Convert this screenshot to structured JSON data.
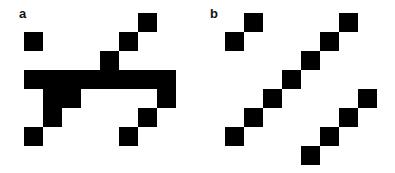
{
  "figure": {
    "cell_size_px": 19,
    "fill_color": "#000000",
    "background_color": "#ffffff",
    "panels": [
      {
        "label": "a",
        "label_pos": [
          19,
          7
        ],
        "origin": [
          24,
          13
        ],
        "rows": 7,
        "cols": 8,
        "filled_cells": [
          [
            0,
            6
          ],
          [
            1,
            0
          ],
          [
            1,
            5
          ],
          [
            2,
            4
          ],
          [
            3,
            0
          ],
          [
            3,
            1
          ],
          [
            3,
            2
          ],
          [
            3,
            3
          ],
          [
            3,
            4
          ],
          [
            3,
            5
          ],
          [
            3,
            6
          ],
          [
            3,
            7
          ],
          [
            4,
            1
          ],
          [
            4,
            2
          ],
          [
            4,
            7
          ],
          [
            5,
            1
          ],
          [
            5,
            6
          ],
          [
            6,
            0
          ],
          [
            6,
            5
          ]
        ]
      },
      {
        "label": "b",
        "label_pos": [
          210,
          7
        ],
        "origin": [
          225,
          13
        ],
        "rows": 8,
        "cols": 8,
        "filled_cells": [
          [
            0,
            1
          ],
          [
            0,
            6
          ],
          [
            1,
            0
          ],
          [
            1,
            5
          ],
          [
            2,
            4
          ],
          [
            3,
            3
          ],
          [
            4,
            2
          ],
          [
            4,
            7
          ],
          [
            5,
            1
          ],
          [
            5,
            6
          ],
          [
            6,
            0
          ],
          [
            6,
            5
          ],
          [
            7,
            4
          ]
        ]
      }
    ]
  }
}
